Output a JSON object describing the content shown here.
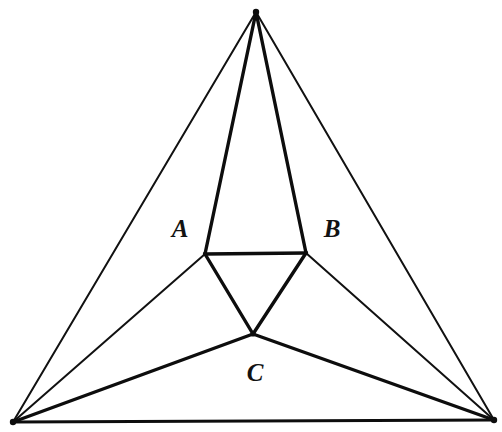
{
  "figure": {
    "background_color": "#ffffff",
    "ink_color": "#0d0d0d",
    "width": 502,
    "height": 432
  },
  "points": {
    "apex": {
      "name": "apex-vertex",
      "x": 256,
      "y": 12
    },
    "bottom_left": {
      "name": "bottom-left-vertex",
      "x": 13,
      "y": 422
    },
    "bottom_right": {
      "name": "bottom-right-vertex",
      "x": 494,
      "y": 420
    },
    "inner_left": {
      "name": "inner-left-vertex",
      "x": 205,
      "y": 254
    },
    "inner_right": {
      "name": "inner-right-vertex",
      "x": 306,
      "y": 253
    },
    "inner_bottom": {
      "name": "inner-bottom-vertex",
      "x": 253,
      "y": 334
    }
  },
  "edges": {
    "outer_left": {
      "label": "apex to bottom-left",
      "weight": "thin"
    },
    "outer_right": {
      "label": "apex to bottom-right",
      "weight": "thin"
    },
    "outer_base": {
      "label": "bottom-left to bottom-right",
      "weight": "thick"
    },
    "spoke_apex_inner_left": {
      "label": "apex to inner-left",
      "weight": "thick"
    },
    "spoke_apex_inner_right": {
      "label": "apex to inner-right",
      "weight": "thick"
    },
    "spoke_bl_inner_left": {
      "label": "bottom-left to inner-left",
      "weight": "thin"
    },
    "spoke_bl_inner_bottom": {
      "label": "bottom-left to inner-bottom",
      "weight": "thick"
    },
    "spoke_br_inner_right": {
      "label": "bottom-right to inner-right",
      "weight": "thin"
    },
    "spoke_br_inner_bottom": {
      "label": "bottom-right to inner-bottom",
      "weight": "thick"
    },
    "inner_top": {
      "label": "inner-left to inner-right",
      "weight": "thick"
    },
    "inner_left_side": {
      "label": "inner-left to inner-bottom",
      "weight": "thick"
    },
    "inner_right_side": {
      "label": "inner-right to inner-bottom",
      "weight": "thick"
    }
  },
  "labels": {
    "a": {
      "text": "A",
      "x": 180,
      "y": 231
    },
    "b": {
      "text": "B",
      "x": 332,
      "y": 231
    },
    "c": {
      "text": "C",
      "x": 255,
      "y": 375
    }
  },
  "chart_data": {
    "type": "diagram",
    "nodes": [
      {
        "id": "apex",
        "x": 256,
        "y": 12,
        "kind": "outer"
      },
      {
        "id": "bottom_left",
        "x": 13,
        "y": 422,
        "kind": "outer"
      },
      {
        "id": "bottom_right",
        "x": 494,
        "y": 420,
        "kind": "outer"
      },
      {
        "id": "inner_left",
        "x": 205,
        "y": 254,
        "kind": "inner"
      },
      {
        "id": "inner_right",
        "x": 306,
        "y": 253,
        "kind": "inner"
      },
      {
        "id": "inner_bottom",
        "x": 253,
        "y": 334,
        "kind": "inner"
      }
    ],
    "links": [
      {
        "from": "apex",
        "to": "bottom_left",
        "weight": "thin"
      },
      {
        "from": "apex",
        "to": "bottom_right",
        "weight": "thin"
      },
      {
        "from": "bottom_left",
        "to": "bottom_right",
        "weight": "thick"
      },
      {
        "from": "apex",
        "to": "inner_left",
        "weight": "thick"
      },
      {
        "from": "apex",
        "to": "inner_right",
        "weight": "thick"
      },
      {
        "from": "bottom_left",
        "to": "inner_left",
        "weight": "thin"
      },
      {
        "from": "bottom_left",
        "to": "inner_bottom",
        "weight": "thick"
      },
      {
        "from": "bottom_right",
        "to": "inner_right",
        "weight": "thin"
      },
      {
        "from": "bottom_right",
        "to": "inner_bottom",
        "weight": "thick"
      },
      {
        "from": "inner_left",
        "to": "inner_right",
        "weight": "thick"
      },
      {
        "from": "inner_left",
        "to": "inner_bottom",
        "weight": "thick"
      },
      {
        "from": "inner_right",
        "to": "inner_bottom",
        "weight": "thick"
      }
    ],
    "annotations": [
      {
        "text": "A",
        "x": 180,
        "y": 231
      },
      {
        "text": "B",
        "x": 332,
        "y": 231
      },
      {
        "text": "C",
        "x": 255,
        "y": 375
      }
    ]
  }
}
